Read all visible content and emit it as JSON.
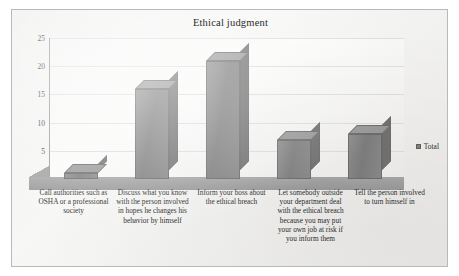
{
  "chart_data": {
    "type": "bar",
    "title": "Ethical judgment",
    "xlabel": "",
    "ylabel": "",
    "ylim": [
      0,
      25
    ],
    "yticks": [
      "0",
      "5",
      "10",
      "15",
      "20",
      "25"
    ],
    "grid": true,
    "legend_position": "right",
    "style": "3d-column",
    "bar_color": "#808080",
    "categories": [
      "Call authorities such as OSHA or a professional society",
      "Discuss what you know with the person involved in hopes he changes his behavior by himself",
      "Inform your boss about the ethical breach",
      "Let somebody outside your department deal with the ethical breach because you may put your own job at risk if you inform them",
      "Tell the person involved to turn himself in"
    ],
    "series": [
      {
        "name": "Total",
        "values": [
          1,
          16,
          21,
          7,
          8
        ]
      }
    ]
  },
  "legend": {
    "entries": [
      {
        "label": "Total",
        "color": "#808080"
      }
    ]
  }
}
